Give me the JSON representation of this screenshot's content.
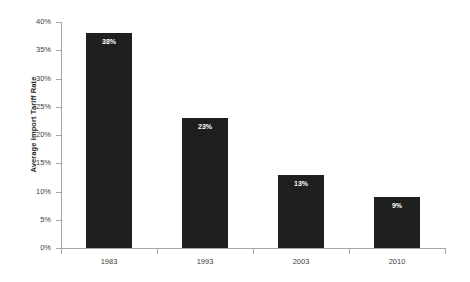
{
  "chart_data": {
    "type": "bar",
    "title": "",
    "subtitle": "",
    "categories": [
      "1983",
      "1993",
      "2003",
      "2010"
    ],
    "values": [
      38,
      23,
      13,
      9
    ],
    "data_labels": [
      "38%",
      "23%",
      "13%",
      "9%"
    ],
    "xlabel": "",
    "ylabel": "Average Import Tariff Rate",
    "ylim": [
      0,
      40
    ],
    "ytick_labels": [
      "0%",
      "5%",
      "10%",
      "15%",
      "20%",
      "25%",
      "30%",
      "35%",
      "40%"
    ],
    "ytick_values": [
      0,
      5,
      10,
      15,
      20,
      25,
      30,
      35,
      40
    ],
    "grid": false,
    "legend": false,
    "legend_position": "none",
    "bar_color": "#1f1f1f",
    "axis_color": "#a6a6a6",
    "label_color": "#404040",
    "background": "#ffffff",
    "value_label_color": "#ffffff"
  }
}
